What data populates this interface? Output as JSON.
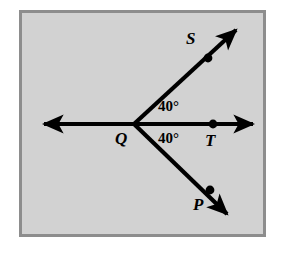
{
  "figure": {
    "kind": "geometry-diagram",
    "background_color": "#d2d2d2",
    "frame_color": "#8d8d8d",
    "ink_color": "#000000",
    "page_color": "#ffffff"
  },
  "points": {
    "vertex": {
      "name": "Q",
      "x": 134,
      "y": 124
    },
    "upper_ray_point": {
      "name": "S",
      "x": 208,
      "y": 57
    },
    "right_ray_point": {
      "name": "T",
      "x": 213,
      "y": 124
    },
    "lower_ray_point": {
      "name": "P",
      "x": 210,
      "y": 190
    }
  },
  "labels": {
    "S": "S",
    "P": "P",
    "T": "T",
    "Q": "Q"
  },
  "angles": {
    "upper": {
      "value": "40°",
      "between": "SQT"
    },
    "lower": {
      "value": "40°",
      "between": "TQP"
    }
  },
  "rays": {
    "horizontal_line": {
      "name": "line through Q and T",
      "from_x": 42,
      "from_y": 124,
      "to_x": 255,
      "to_y": 124,
      "arrows": "both"
    },
    "ray_QS": {
      "name": "ray Q to S",
      "from_x": 134,
      "from_y": 124,
      "to_x": 238,
      "to_y": 28,
      "arrows": "end"
    },
    "ray_QP": {
      "name": "ray Q to P",
      "from_x": 134,
      "from_y": 124,
      "to_x": 229,
      "to_y": 216,
      "arrows": "end"
    }
  }
}
